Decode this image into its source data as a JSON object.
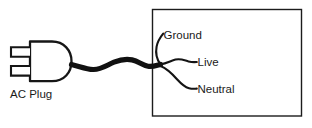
{
  "diagram": {
    "background_color": "#ffffff",
    "line_color": "#161616",
    "labels": {
      "plug": "AC Plug",
      "ground": "Ground",
      "live": "Live",
      "neutral": "Neutral"
    },
    "components": {
      "plug": {
        "name": "AC Plug",
        "prong_count": 2,
        "shape": "d-shape"
      },
      "cable": {
        "name": "power cable",
        "style": "thick-wavy"
      },
      "enclosure": {
        "name": "equipment enclosure",
        "shape": "rectangle",
        "fill": "#ffffff",
        "stroke": "#1c1c1c"
      },
      "wires": [
        {
          "name": "ground",
          "label": "Ground",
          "direction": "up"
        },
        {
          "name": "live",
          "label": "Live",
          "direction": "right"
        },
        {
          "name": "neutral",
          "label": "Neutral",
          "direction": "down-right"
        }
      ]
    }
  }
}
